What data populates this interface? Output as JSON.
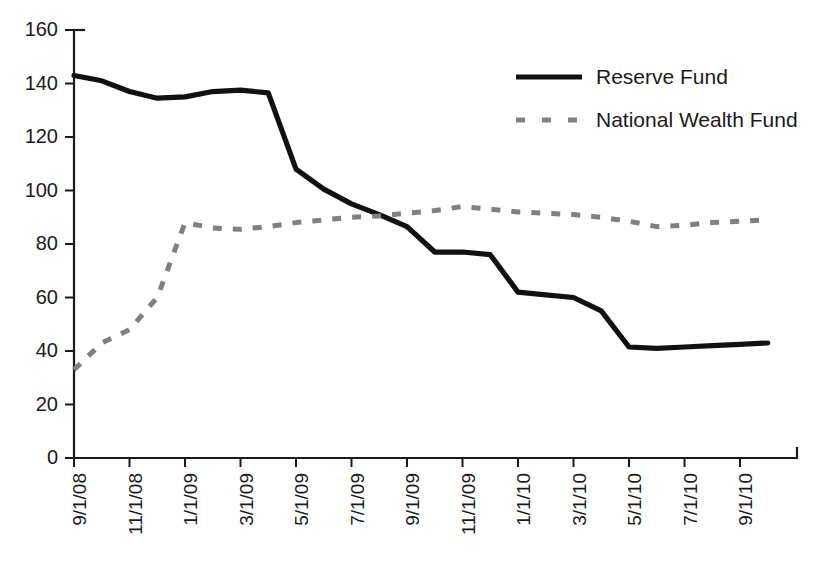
{
  "chart_data": {
    "type": "line",
    "title": "",
    "xlabel": "",
    "ylabel": "",
    "ylim": [
      0,
      160
    ],
    "ytick_step": 20,
    "yticks": [
      0,
      20,
      40,
      60,
      80,
      100,
      120,
      140,
      160
    ],
    "grid": false,
    "legend_position": "top-right",
    "x": [
      "9/1/08",
      "10/1/08",
      "11/1/08",
      "12/1/08",
      "1/1/09",
      "2/1/09",
      "3/1/09",
      "4/1/09",
      "5/1/09",
      "6/1/09",
      "7/1/09",
      "8/1/09",
      "9/1/09",
      "10/1/09",
      "11/1/09",
      "12/1/09",
      "1/1/10",
      "2/1/10",
      "3/1/10",
      "4/1/10",
      "5/1/10",
      "6/1/10",
      "7/1/10",
      "8/1/10",
      "9/1/10",
      "10/1/10"
    ],
    "xtick_labels": [
      "9/1/08",
      "11/1/08",
      "1/1/09",
      "3/1/09",
      "5/1/09",
      "7/1/09",
      "9/1/09",
      "11/1/09",
      "1/1/10",
      "3/1/10",
      "5/1/10",
      "7/1/10",
      "9/1/10"
    ],
    "xtick_indices": [
      0,
      2,
      4,
      6,
      8,
      10,
      12,
      14,
      16,
      18,
      20,
      22,
      24
    ],
    "series": [
      {
        "name": "Reserve Fund",
        "style": "solid",
        "color": "#111111",
        "values": [
          143,
          141,
          137,
          134.5,
          135,
          137,
          137.5,
          136.5,
          108,
          100.5,
          95,
          91,
          86.5,
          77,
          77,
          76,
          62,
          61,
          60,
          55,
          41.5,
          41,
          41.5,
          42,
          42.5,
          43
        ]
      },
      {
        "name": "National Wealth Fund",
        "style": "dashed",
        "color": "#808080",
        "values": [
          33,
          43,
          48,
          60,
          88,
          86,
          85.5,
          86.5,
          88,
          89,
          90,
          90.5,
          91.5,
          92.5,
          94,
          93,
          92,
          91.5,
          91,
          90,
          88.5,
          86.5,
          87,
          88,
          88.5,
          89
        ]
      }
    ]
  },
  "legend": {
    "items": [
      {
        "label": "Reserve Fund"
      },
      {
        "label": "National Wealth Fund"
      }
    ]
  }
}
